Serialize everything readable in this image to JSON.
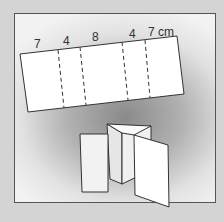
{
  "diagram": {
    "strip_labels": [
      "7",
      "4",
      "8",
      "4",
      "7 cm"
    ],
    "segments_cm": [
      7,
      4,
      8,
      4,
      7
    ],
    "unit": "cm",
    "fold_lines": 4,
    "folded_result": "zigzag folded panels standing upright",
    "colors": {
      "frame_border": "#555555",
      "paper": "#ffffff",
      "background": "#d4d4d4"
    }
  }
}
